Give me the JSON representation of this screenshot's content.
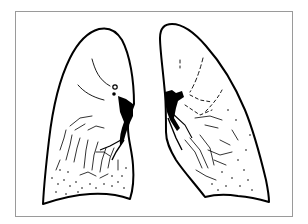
{
  "figure": {
    "title": "",
    "frame_color": "#9a9a9a",
    "ink_color": "#000000",
    "background": "#ffffff"
  },
  "lungs": [
    {
      "id": "right-lung",
      "side": "viewer-left"
    },
    {
      "id": "left-lung",
      "side": "viewer-right"
    }
  ]
}
